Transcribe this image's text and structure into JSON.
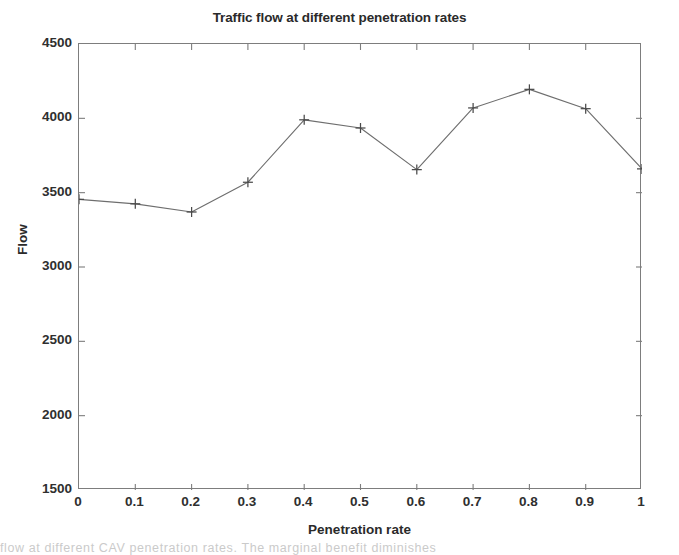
{
  "figure": {
    "title": "Traffic flow at different penetration rates",
    "background_color": "#ffffff",
    "axis_color": "#7d7d7d",
    "line_color": "#6e6e6e",
    "marker_color": "#4a4a4a",
    "text_color": "#2a2a2a"
  },
  "page_caption": "flow at different CAV penetration rates. The marginal benefit diminishes",
  "chart_data": {
    "type": "line",
    "title": "Traffic flow at different penetration rates",
    "xlabel": "Penetration rate",
    "ylabel": "Flow",
    "x": [
      0,
      0.1,
      0.2,
      0.3,
      0.4,
      0.5,
      0.6,
      0.7,
      0.8,
      0.9,
      1
    ],
    "values": [
      3455,
      3425,
      3370,
      3570,
      3990,
      3935,
      3655,
      4070,
      4195,
      4065,
      3660
    ],
    "series": [
      {
        "name": "Flow",
        "values": [
          3455,
          3425,
          3370,
          3570,
          3990,
          3935,
          3655,
          4070,
          4195,
          4065,
          3660
        ],
        "marker": "plus",
        "line_style": "solid"
      }
    ],
    "xlim": [
      0,
      1
    ],
    "ylim": [
      1500,
      4500
    ],
    "xticks": [
      0,
      0.1,
      0.2,
      0.3,
      0.4,
      0.5,
      0.6,
      0.7,
      0.8,
      0.9,
      1
    ],
    "xticklabels": [
      "0",
      "0.1",
      "0.2",
      "0.3",
      "0.4",
      "0.5",
      "0.6",
      "0.7",
      "0.8",
      "0.9",
      "1"
    ],
    "yticks": [
      1500,
      2000,
      2500,
      3000,
      3500,
      4000,
      4500
    ],
    "yticklabels": [
      "1500",
      "2000",
      "2500",
      "3000",
      "3500",
      "4000",
      "4500"
    ],
    "grid": false,
    "legend": null
  }
}
